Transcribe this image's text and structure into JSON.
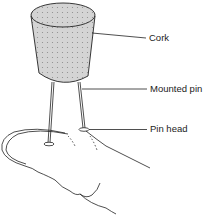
{
  "diagram": {
    "labels": {
      "cork": "Cork",
      "mounted_pin": "Mounted pin",
      "pin_head": "Pin head"
    },
    "parts": [
      "cork",
      "mounted-pin-left",
      "mounted-pin-right",
      "pin-head-left",
      "pin-head-right",
      "finger"
    ],
    "colors": {
      "cork_fill": "#d4d4d4",
      "cork_dots": "#8a8a8a",
      "line": "#222222"
    }
  }
}
